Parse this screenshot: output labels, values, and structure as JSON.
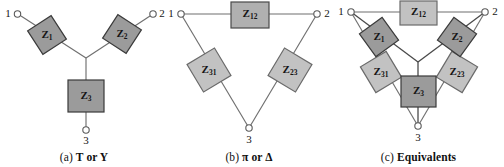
{
  "figure": {
    "background_color": "#ffffff",
    "line_color": "#6f6f6f",
    "box_fill_dark": "#9b9b9b",
    "box_fill_light": "#c2c2c2",
    "box_stroke": "#3a3a3a"
  },
  "panels": [
    {
      "id": "a",
      "caption": "(a) T or Y",
      "caption_prefix": "(a)",
      "caption_text": "T or Y",
      "terminals": [
        {
          "name": "terminal-1",
          "label": "1"
        },
        {
          "name": "terminal-2",
          "label": "2"
        },
        {
          "name": "terminal-3",
          "label": "3"
        }
      ],
      "impedances": [
        {
          "name": "impedance-z1",
          "symbol": "Z",
          "subscript": "1",
          "shade": "dark"
        },
        {
          "name": "impedance-z2",
          "symbol": "Z",
          "subscript": "2",
          "shade": "dark"
        },
        {
          "name": "impedance-z3",
          "symbol": "Z",
          "subscript": "3",
          "shade": "dark"
        }
      ]
    },
    {
      "id": "b",
      "caption": "(b) π or Δ",
      "caption_prefix": "(b)",
      "caption_text": "π or Δ",
      "terminals": [
        {
          "name": "terminal-1",
          "label": "1"
        },
        {
          "name": "terminal-2",
          "label": "2"
        },
        {
          "name": "terminal-3",
          "label": "3"
        }
      ],
      "impedances": [
        {
          "name": "impedance-z12",
          "symbol": "Z",
          "subscript": "12",
          "shade": "mid"
        },
        {
          "name": "impedance-z31",
          "symbol": "Z",
          "subscript": "31",
          "shade": "light"
        },
        {
          "name": "impedance-z23",
          "symbol": "Z",
          "subscript": "23",
          "shade": "light"
        }
      ]
    },
    {
      "id": "c",
      "caption": "(c) Equivalents",
      "caption_prefix": "(c)",
      "caption_text": "Equivalents",
      "terminals": [
        {
          "name": "terminal-1",
          "label": "1"
        },
        {
          "name": "terminal-2",
          "label": "2"
        },
        {
          "name": "terminal-3",
          "label": "3"
        }
      ],
      "impedances": [
        {
          "name": "impedance-z12",
          "symbol": "Z",
          "subscript": "12",
          "shade": "light"
        },
        {
          "name": "impedance-z1",
          "symbol": "Z",
          "subscript": "1",
          "shade": "dark"
        },
        {
          "name": "impedance-z2",
          "symbol": "Z",
          "subscript": "2",
          "shade": "dark"
        },
        {
          "name": "impedance-z31",
          "symbol": "Z",
          "subscript": "31",
          "shade": "light"
        },
        {
          "name": "impedance-z23",
          "symbol": "Z",
          "subscript": "23",
          "shade": "light"
        },
        {
          "name": "impedance-z3",
          "symbol": "Z",
          "subscript": "3",
          "shade": "dark"
        }
      ]
    }
  ]
}
